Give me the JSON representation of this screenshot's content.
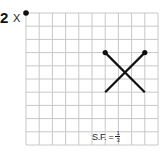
{
  "question": {
    "number": "2",
    "center_label": "X"
  },
  "grid": {
    "columns": 10,
    "rows": 10,
    "origin_px": [
      26,
      13
    ],
    "cell_px": 13.2,
    "line_color": "#c8c8c8"
  },
  "shape": {
    "segments": [
      {
        "from": [
          6,
          3
        ],
        "to": [
          9,
          6
        ]
      },
      {
        "from": [
          9,
          3
        ],
        "to": [
          6,
          6
        ]
      }
    ],
    "endpoint_dots": [
      [
        6,
        3
      ],
      [
        9,
        3
      ]
    ],
    "stroke_color": "#111111"
  },
  "center_point": [
    0,
    0
  ],
  "scale_factor": {
    "prefix": "S.F. =",
    "numerator": "1",
    "denominator": "3"
  }
}
